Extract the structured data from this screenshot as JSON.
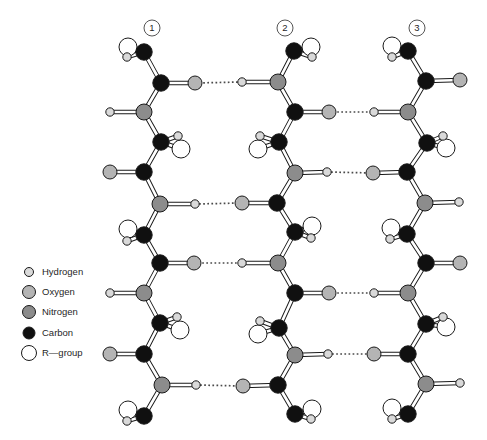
{
  "figure": {
    "width": 487,
    "height": 440,
    "background": "#ffffff"
  },
  "chain_labels": [
    {
      "number": "1",
      "x": 152,
      "y": 28
    },
    {
      "number": "2",
      "x": 285,
      "y": 28
    },
    {
      "number": "3",
      "x": 417,
      "y": 28
    }
  ],
  "elements": {
    "H": {
      "name": "hydrogen",
      "fill": "#d9d9d9",
      "r": 4.2
    },
    "O": {
      "name": "oxygen",
      "fill": "#b4b4b4",
      "r": 7
    },
    "N": {
      "name": "nitrogen",
      "fill": "#8c8c8c",
      "r": 8
    },
    "C": {
      "name": "carbon",
      "fill": "#101010",
      "r": 8.2
    },
    "R": {
      "name": "r-group",
      "fill": "#ffffff",
      "r": 9
    }
  },
  "legend": {
    "circle_x": 29,
    "text_x": 42,
    "items": [
      {
        "element": "H",
        "label": "Hydrogen",
        "y": 272,
        "r": 4.5
      },
      {
        "element": "O",
        "label": "Oxygen",
        "y": 292,
        "r": 6.5
      },
      {
        "element": "N",
        "label": "Nitrogen",
        "y": 312,
        "r": 6.5
      },
      {
        "element": "C",
        "label": "Carbon",
        "y": 333,
        "r": 6
      },
      {
        "element": "R",
        "label": "R—group",
        "y": 353,
        "r": 7.5
      }
    ]
  },
  "structure": {
    "chains": [
      {
        "id": "1",
        "backbone": [
          {
            "el": "C",
            "x": 144,
            "y": 52,
            "subs": [
              {
                "el": "R",
                "x": 128,
                "y": 47
              },
              {
                "el": "H",
                "x": 127,
                "y": 57
              }
            ]
          },
          {
            "el": "C",
            "x": 161,
            "y": 83,
            "subs": [
              {
                "el": "O",
                "x": 195,
                "y": 83
              }
            ]
          },
          {
            "el": "N",
            "x": 144,
            "y": 112,
            "subs": [
              {
                "el": "H",
                "x": 110,
                "y": 112
              }
            ]
          },
          {
            "el": "C",
            "x": 161,
            "y": 142,
            "subs": [
              {
                "el": "R",
                "x": 181,
                "y": 149
              },
              {
                "el": "H",
                "x": 178,
                "y": 136
              }
            ]
          },
          {
            "el": "C",
            "x": 144,
            "y": 172,
            "subs": [
              {
                "el": "O",
                "x": 110,
                "y": 172
              }
            ]
          },
          {
            "el": "N",
            "x": 160,
            "y": 204,
            "subs": [
              {
                "el": "H",
                "x": 195,
                "y": 204
              }
            ]
          },
          {
            "el": "C",
            "x": 144,
            "y": 235,
            "subs": [
              {
                "el": "R",
                "x": 128,
                "y": 229
              },
              {
                "el": "H",
                "x": 127,
                "y": 241
              }
            ]
          },
          {
            "el": "C",
            "x": 160,
            "y": 263,
            "subs": [
              {
                "el": "O",
                "x": 194,
                "y": 263
              }
            ]
          },
          {
            "el": "N",
            "x": 144,
            "y": 293,
            "subs": [
              {
                "el": "H",
                "x": 110,
                "y": 293
              }
            ]
          },
          {
            "el": "C",
            "x": 160,
            "y": 323,
            "subs": [
              {
                "el": "R",
                "x": 180,
                "y": 330
              },
              {
                "el": "H",
                "x": 177,
                "y": 317
              }
            ]
          },
          {
            "el": "C",
            "x": 144,
            "y": 354,
            "subs": [
              {
                "el": "O",
                "x": 110,
                "y": 354
              }
            ]
          },
          {
            "el": "N",
            "x": 162,
            "y": 385,
            "subs": [
              {
                "el": "H",
                "x": 196,
                "y": 385
              }
            ]
          },
          {
            "el": "C",
            "x": 144,
            "y": 416,
            "subs": [
              {
                "el": "R",
                "x": 128,
                "y": 410
              },
              {
                "el": "H",
                "x": 127,
                "y": 421
              }
            ]
          }
        ]
      },
      {
        "id": "2",
        "backbone": [
          {
            "el": "C",
            "x": 294,
            "y": 51,
            "subs": [
              {
                "el": "R",
                "x": 311,
                "y": 47
              },
              {
                "el": "H",
                "x": 312,
                "y": 57
              }
            ]
          },
          {
            "el": "N",
            "x": 278,
            "y": 82,
            "subs": [
              {
                "el": "H",
                "x": 242,
                "y": 82
              }
            ]
          },
          {
            "el": "C",
            "x": 295,
            "y": 112,
            "subs": [
              {
                "el": "O",
                "x": 329,
                "y": 112
              }
            ]
          },
          {
            "el": "C",
            "x": 279,
            "y": 142,
            "subs": [
              {
                "el": "R",
                "x": 258,
                "y": 149
              },
              {
                "el": "H",
                "x": 260,
                "y": 136
              }
            ]
          },
          {
            "el": "N",
            "x": 295,
            "y": 173,
            "subs": [
              {
                "el": "H",
                "x": 327,
                "y": 172
              }
            ]
          },
          {
            "el": "C",
            "x": 277,
            "y": 203,
            "subs": [
              {
                "el": "O",
                "x": 242,
                "y": 203
              }
            ]
          },
          {
            "el": "C",
            "x": 295,
            "y": 232,
            "subs": [
              {
                "el": "R",
                "x": 312,
                "y": 226
              },
              {
                "el": "H",
                "x": 311,
                "y": 238
              }
            ]
          },
          {
            "el": "N",
            "x": 278,
            "y": 263,
            "subs": [
              {
                "el": "H",
                "x": 242,
                "y": 263
              }
            ]
          },
          {
            "el": "C",
            "x": 295,
            "y": 293,
            "subs": [
              {
                "el": "O",
                "x": 329,
                "y": 293
              }
            ]
          },
          {
            "el": "C",
            "x": 279,
            "y": 328,
            "subs": [
              {
                "el": "R",
                "x": 258,
                "y": 334
              },
              {
                "el": "H",
                "x": 260,
                "y": 321
              }
            ]
          },
          {
            "el": "N",
            "x": 295,
            "y": 355,
            "subs": [
              {
                "el": "H",
                "x": 328,
                "y": 354
              }
            ]
          },
          {
            "el": "C",
            "x": 278,
            "y": 385,
            "subs": [
              {
                "el": "O",
                "x": 243,
                "y": 386
              }
            ]
          },
          {
            "el": "C",
            "x": 295,
            "y": 414,
            "subs": [
              {
                "el": "R",
                "x": 312,
                "y": 409
              },
              {
                "el": "H",
                "x": 311,
                "y": 419
              }
            ]
          }
        ]
      },
      {
        "id": "3",
        "backbone": [
          {
            "el": "C",
            "x": 408,
            "y": 51,
            "subs": [
              {
                "el": "R",
                "x": 392,
                "y": 46
              },
              {
                "el": "H",
                "x": 392,
                "y": 57
              }
            ]
          },
          {
            "el": "C",
            "x": 426,
            "y": 81,
            "subs": [
              {
                "el": "O",
                "x": 460,
                "y": 80
              }
            ]
          },
          {
            "el": "N",
            "x": 408,
            "y": 112,
            "subs": [
              {
                "el": "H",
                "x": 374,
                "y": 112
              }
            ]
          },
          {
            "el": "C",
            "x": 427,
            "y": 143,
            "subs": [
              {
                "el": "R",
                "x": 446,
                "y": 148
              },
              {
                "el": "H",
                "x": 443,
                "y": 136
              }
            ]
          },
          {
            "el": "C",
            "x": 407,
            "y": 172,
            "subs": [
              {
                "el": "O",
                "x": 373,
                "y": 173
              }
            ]
          },
          {
            "el": "N",
            "x": 425,
            "y": 203,
            "subs": [
              {
                "el": "H",
                "x": 459,
                "y": 202
              }
            ]
          },
          {
            "el": "C",
            "x": 407,
            "y": 234,
            "subs": [
              {
                "el": "R",
                "x": 391,
                "y": 228
              },
              {
                "el": "H",
                "x": 390,
                "y": 239
              }
            ]
          },
          {
            "el": "C",
            "x": 426,
            "y": 263,
            "subs": [
              {
                "el": "O",
                "x": 460,
                "y": 263
              }
            ]
          },
          {
            "el": "N",
            "x": 408,
            "y": 293,
            "subs": [
              {
                "el": "H",
                "x": 374,
                "y": 293
              }
            ]
          },
          {
            "el": "C",
            "x": 426,
            "y": 324,
            "subs": [
              {
                "el": "R",
                "x": 446,
                "y": 327
              },
              {
                "el": "H",
                "x": 443,
                "y": 317
              }
            ]
          },
          {
            "el": "C",
            "x": 408,
            "y": 354,
            "subs": [
              {
                "el": "O",
                "x": 374,
                "y": 354
              }
            ]
          },
          {
            "el": "N",
            "x": 426,
            "y": 384,
            "subs": [
              {
                "el": "H",
                "x": 460,
                "y": 383
              }
            ]
          },
          {
            "el": "C",
            "x": 408,
            "y": 414,
            "subs": [
              {
                "el": "R",
                "x": 392,
                "y": 408
              },
              {
                "el": "H",
                "x": 392,
                "y": 419
              }
            ]
          }
        ]
      }
    ],
    "hydrogen_bonds": [
      {
        "x1": 195,
        "y1": 83,
        "x2": 242,
        "y2": 82
      },
      {
        "x1": 195,
        "y1": 204,
        "x2": 242,
        "y2": 203
      },
      {
        "x1": 194,
        "y1": 263,
        "x2": 242,
        "y2": 263
      },
      {
        "x1": 196,
        "y1": 385,
        "x2": 243,
        "y2": 386
      },
      {
        "x1": 329,
        "y1": 112,
        "x2": 374,
        "y2": 112
      },
      {
        "x1": 327,
        "y1": 172,
        "x2": 373,
        "y2": 173
      },
      {
        "x1": 329,
        "y1": 293,
        "x2": 374,
        "y2": 293
      },
      {
        "x1": 328,
        "y1": 354,
        "x2": 374,
        "y2": 354
      }
    ]
  },
  "style": {
    "bond_outline": "#1a1a1a",
    "bond_core": "#ffffff",
    "hbond_color": "#4a4a4a",
    "atom_stroke": "#1a1a1a",
    "label_circle_stroke": "#555555",
    "label_circle_fill": "#ffffff"
  }
}
